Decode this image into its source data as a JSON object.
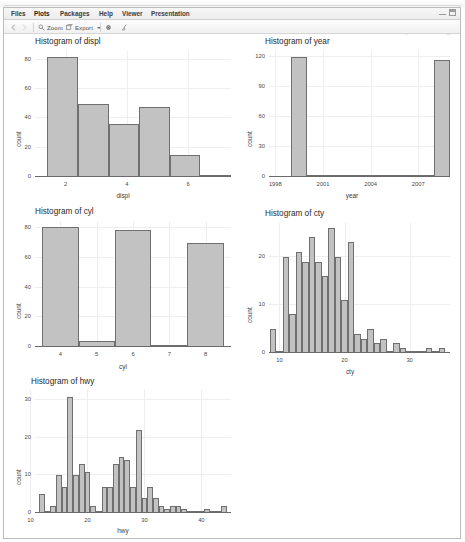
{
  "window": {
    "minimize_label": "minimize",
    "maximize_label": "maximize"
  },
  "tabs": [
    {
      "label": "Files",
      "selected": false
    },
    {
      "label": "Plots",
      "selected": true
    },
    {
      "label": "Packages",
      "selected": false
    },
    {
      "label": "Help",
      "selected": false
    },
    {
      "label": "Viewer",
      "selected": false
    },
    {
      "label": "Presentation",
      "selected": false
    }
  ],
  "toolbar": {
    "back_icon": "arrow-left-icon",
    "forward_icon": "arrow-right-icon",
    "zoom_label": "Zoom",
    "zoom_icon": "magnifier-icon",
    "export_label": "Export",
    "export_icon": "export-icon",
    "export_caret": "chevron-down-icon",
    "remove_icon": "gear-icon",
    "clear_icon": "broom-icon",
    "publish_label": "Publish",
    "publish_icon": "publish-icon",
    "publish_caret": "chevron-down-icon",
    "refresh_icon": "refresh-icon"
  },
  "chart_data": [
    {
      "type": "bar",
      "title": "Histogram of displ",
      "xlabel": "displ",
      "ylabel": "count",
      "xlim": [
        1.0,
        7.4
      ],
      "ylim": [
        0,
        86
      ],
      "xticks": [
        2,
        4,
        6
      ],
      "yticks": [
        0,
        20,
        40,
        60,
        80
      ],
      "grid": true,
      "bin_width": 1.0,
      "bin_edges": [
        1.4,
        2.4,
        3.4,
        4.4,
        5.4,
        6.4,
        7.4
      ],
      "values": [
        82,
        50,
        36,
        48,
        15,
        1
      ],
      "categories": [
        "1.4-2.4",
        "2.4-3.4",
        "3.4-4.4",
        "4.4-5.4",
        "5.4-6.4",
        "6.4-7.4"
      ]
    },
    {
      "type": "bar",
      "title": "Histogram of year",
      "xlabel": "year",
      "ylabel": "count",
      "xlim": [
        1997.6,
        2009.0
      ],
      "ylim": [
        0,
        126
      ],
      "xticks": [
        1998,
        2001,
        2004,
        2007
      ],
      "yticks": [
        0,
        30,
        60,
        90,
        120
      ],
      "grid": true,
      "bin_edges": [
        1999,
        2000,
        2008,
        2009
      ],
      "values": [
        120,
        0,
        117
      ],
      "categories": [
        "1999",
        "2000-2007",
        "2008"
      ]
    },
    {
      "type": "bar",
      "title": "Histogram of cyl",
      "xlabel": "cyl",
      "ylabel": "count",
      "xlim": [
        3.3,
        8.7
      ],
      "ylim": [
        0,
        85
      ],
      "xticks": [
        4,
        5,
        6,
        7,
        8
      ],
      "yticks": [
        0,
        20,
        40,
        60,
        80
      ],
      "grid": true,
      "bin_width": 1,
      "categories": [
        "4",
        "5",
        "6",
        "7",
        "8"
      ],
      "values": [
        81,
        4,
        79,
        0,
        70
      ]
    },
    {
      "type": "bar",
      "title": "Histogram of cty",
      "xlabel": "cty",
      "ylabel": "count",
      "xlim": [
        8.4,
        36.2
      ],
      "ylim": [
        0,
        27
      ],
      "xticks": [
        10,
        20,
        30
      ],
      "yticks": [
        0,
        10,
        20
      ],
      "grid": true,
      "bin_width": 1,
      "categories": [
        "9",
        "10",
        "11",
        "12",
        "13",
        "14",
        "15",
        "16",
        "17",
        "18",
        "19",
        "20",
        "21",
        "22",
        "23",
        "24",
        "25",
        "26",
        "27",
        "28",
        "29",
        "30",
        "31",
        "32",
        "33",
        "34",
        "35"
      ],
      "values": [
        5,
        0,
        20,
        8,
        21,
        19,
        24,
        19,
        16,
        26,
        20,
        11,
        23,
        4,
        3,
        5,
        2,
        3,
        0,
        2,
        1,
        0,
        0,
        0,
        1,
        0,
        1
      ]
    },
    {
      "type": "bar",
      "title": "Histogram of hwy",
      "xlabel": "hwy",
      "ylabel": "count",
      "xlim": [
        10.8,
        45.2
      ],
      "ylim": [
        0,
        33
      ],
      "xticks": [
        10,
        20,
        30,
        40
      ],
      "yticks": [
        0,
        10,
        20,
        30
      ],
      "grid": true,
      "bin_width": 1,
      "categories": [
        "12",
        "13",
        "14",
        "15",
        "16",
        "17",
        "18",
        "19",
        "20",
        "21",
        "22",
        "23",
        "24",
        "25",
        "26",
        "27",
        "28",
        "29",
        "30",
        "31",
        "32",
        "33",
        "34",
        "35",
        "36",
        "37",
        "38",
        "39",
        "40",
        "41",
        "42",
        "43",
        "44"
      ],
      "values": [
        5,
        0,
        2,
        10,
        7,
        31,
        10,
        13,
        11,
        2,
        0,
        7,
        7,
        13,
        15,
        14,
        7,
        22,
        4,
        7,
        4,
        2,
        1,
        2,
        2,
        1,
        0,
        0,
        0,
        1,
        0,
        0,
        2
      ]
    }
  ]
}
